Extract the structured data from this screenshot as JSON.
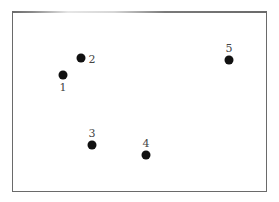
{
  "diagram": {
    "points": [
      {
        "id": "1",
        "label": "1",
        "x": 63,
        "y": 75,
        "label_x": 63,
        "label_y": 87
      },
      {
        "id": "2",
        "label": "2",
        "x": 81,
        "y": 58,
        "label_x": 92,
        "label_y": 59
      },
      {
        "id": "3",
        "label": "3",
        "x": 92,
        "y": 145,
        "label_x": 92,
        "label_y": 133
      },
      {
        "id": "4",
        "label": "4",
        "x": 146,
        "y": 155,
        "label_x": 146,
        "label_y": 143
      },
      {
        "id": "5",
        "label": "5",
        "x": 229,
        "y": 60,
        "label_x": 229,
        "label_y": 48
      }
    ],
    "colors": {
      "point": "#111111",
      "label": "#444444",
      "border": "#6a6a6a"
    }
  }
}
